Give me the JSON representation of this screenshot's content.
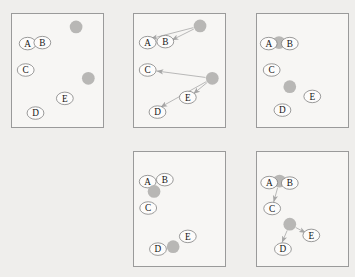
{
  "figure": {
    "style": {
      "page_bg": "#efeeec",
      "panel_bg": "#f7f6f4",
      "panel_border": "#9a9a9a",
      "node_fill": "#fdfcfb",
      "node_stroke": "#7f7f7f",
      "node_text": "#151515",
      "disc_fill": "#b8b7b5",
      "arrow_color": "#a6a6a6",
      "disc_r": 6.5,
      "node_rx": 8.6,
      "node_ry": 6.4
    },
    "node_labels": [
      "A",
      "B",
      "C",
      "D",
      "E"
    ],
    "panels": [
      {
        "id": "panel-1",
        "x": 11,
        "y": 13,
        "w": 93,
        "h": 115,
        "items": [
          {
            "t": "disc",
            "x": 65.5,
            "y": 13
          },
          {
            "t": "disc",
            "x": 78,
            "y": 65.5
          },
          {
            "t": "node",
            "label": "A",
            "x": 16,
            "y": 30
          },
          {
            "t": "node",
            "label": "B",
            "x": 31,
            "y": 29
          },
          {
            "t": "node",
            "label": "C",
            "x": 14,
            "y": 57
          },
          {
            "t": "node",
            "label": "E",
            "x": 54,
            "y": 86
          },
          {
            "t": "node",
            "label": "D",
            "x": 24,
            "y": 101
          }
        ]
      },
      {
        "id": "panel-2",
        "x": 133,
        "y": 13,
        "w": 93,
        "h": 115,
        "items": [
          {
            "t": "disc",
            "x": 67.5,
            "y": 12
          },
          {
            "t": "disc",
            "x": 80,
            "y": 65.5
          },
          {
            "t": "arrow",
            "x1": 60.7,
            "y1": 13.7,
            "x2": 17,
            "y2": 25
          },
          {
            "t": "arrow",
            "x1": 61.2,
            "y1": 15.1,
            "x2": 38.5,
            "y2": 26.5
          },
          {
            "t": "arrow",
            "x1": 73.1,
            "y1": 64.6,
            "x2": 23,
            "y2": 58
          },
          {
            "t": "arrow",
            "x1": 73.9,
            "y1": 68.9,
            "x2": 27,
            "y2": 95
          },
          {
            "t": "arrow",
            "x1": 74.6,
            "y1": 69.9,
            "x2": 60.5,
            "y2": 81.5
          },
          {
            "t": "node",
            "label": "A",
            "x": 14,
            "y": 29
          },
          {
            "t": "node",
            "label": "B",
            "x": 32,
            "y": 28
          },
          {
            "t": "node",
            "label": "C",
            "x": 14,
            "y": 57
          },
          {
            "t": "node",
            "label": "E",
            "x": 55,
            "y": 85
          },
          {
            "t": "node",
            "label": "D",
            "x": 24,
            "y": 100
          }
        ]
      },
      {
        "id": "panel-3",
        "x": 256,
        "y": 13,
        "w": 93,
        "h": 115,
        "items": [
          {
            "t": "disc",
            "x": 22.5,
            "y": 29
          },
          {
            "t": "node",
            "label": "A",
            "x": 12,
            "y": 30
          },
          {
            "t": "node",
            "label": "B",
            "x": 33.5,
            "y": 30
          },
          {
            "t": "disc",
            "x": 33.5,
            "y": 74
          },
          {
            "t": "node",
            "label": "C",
            "x": 15,
            "y": 57
          },
          {
            "t": "node",
            "label": "E",
            "x": 56.5,
            "y": 84
          },
          {
            "t": "node",
            "label": "D",
            "x": 26,
            "y": 98
          }
        ]
      },
      {
        "id": "panel-4",
        "x": 133,
        "y": 151,
        "w": 93,
        "h": 116,
        "items": [
          {
            "t": "node",
            "label": "A",
            "x": 14,
            "y": 30
          },
          {
            "t": "node",
            "label": "B",
            "x": 31.5,
            "y": 28
          },
          {
            "t": "disc",
            "x": 20.5,
            "y": 40
          },
          {
            "t": "node",
            "label": "C",
            "x": 14.5,
            "y": 57
          },
          {
            "t": "node",
            "label": "D",
            "x": 24.5,
            "y": 99
          },
          {
            "t": "disc",
            "x": 40,
            "y": 96.5
          },
          {
            "t": "node",
            "label": "E",
            "x": 55,
            "y": 86
          }
        ]
      },
      {
        "id": "panel-5",
        "x": 256,
        "y": 151,
        "w": 93,
        "h": 116,
        "items": [
          {
            "t": "disc",
            "x": 23,
            "y": 29.5
          },
          {
            "t": "node",
            "label": "A",
            "x": 12.5,
            "y": 31
          },
          {
            "t": "node",
            "label": "B",
            "x": 33.5,
            "y": 31.5
          },
          {
            "t": "arrow",
            "x1": 21.1,
            "y1": 36.2,
            "x2": 17,
            "y2": 51
          },
          {
            "t": "disc",
            "x": 33.5,
            "y": 73.5
          },
          {
            "t": "arrow",
            "x1": 30.8,
            "y1": 80,
            "x2": 25.5,
            "y2": 92.5
          },
          {
            "t": "arrow",
            "x1": 39.6,
            "y1": 76.9,
            "x2": 50,
            "y2": 82.5
          },
          {
            "t": "node",
            "label": "C",
            "x": 15.5,
            "y": 57.5
          },
          {
            "t": "node",
            "label": "E",
            "x": 55.5,
            "y": 85
          },
          {
            "t": "node",
            "label": "D",
            "x": 26.5,
            "y": 99
          }
        ]
      }
    ]
  }
}
